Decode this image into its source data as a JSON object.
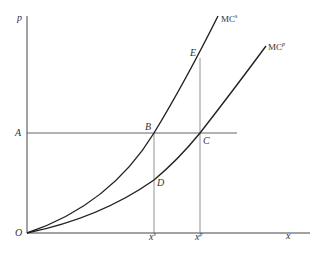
{
  "diagram": {
    "type": "economics-marginal-cost",
    "axes": {
      "y_label": "p",
      "x_label": "x",
      "origin_label": "O"
    },
    "price_level_label": "A",
    "curves": [
      {
        "name": "MC",
        "superscript": "s",
        "label": "MC^s"
      },
      {
        "name": "MC",
        "superscript": "p",
        "label": "MC^p"
      }
    ],
    "points": {
      "B": "B",
      "C": "C",
      "D": "D",
      "E": "E"
    },
    "x_ticks": [
      {
        "base": "x",
        "superscript": "s"
      },
      {
        "base": "x",
        "superscript": "p"
      }
    ]
  }
}
